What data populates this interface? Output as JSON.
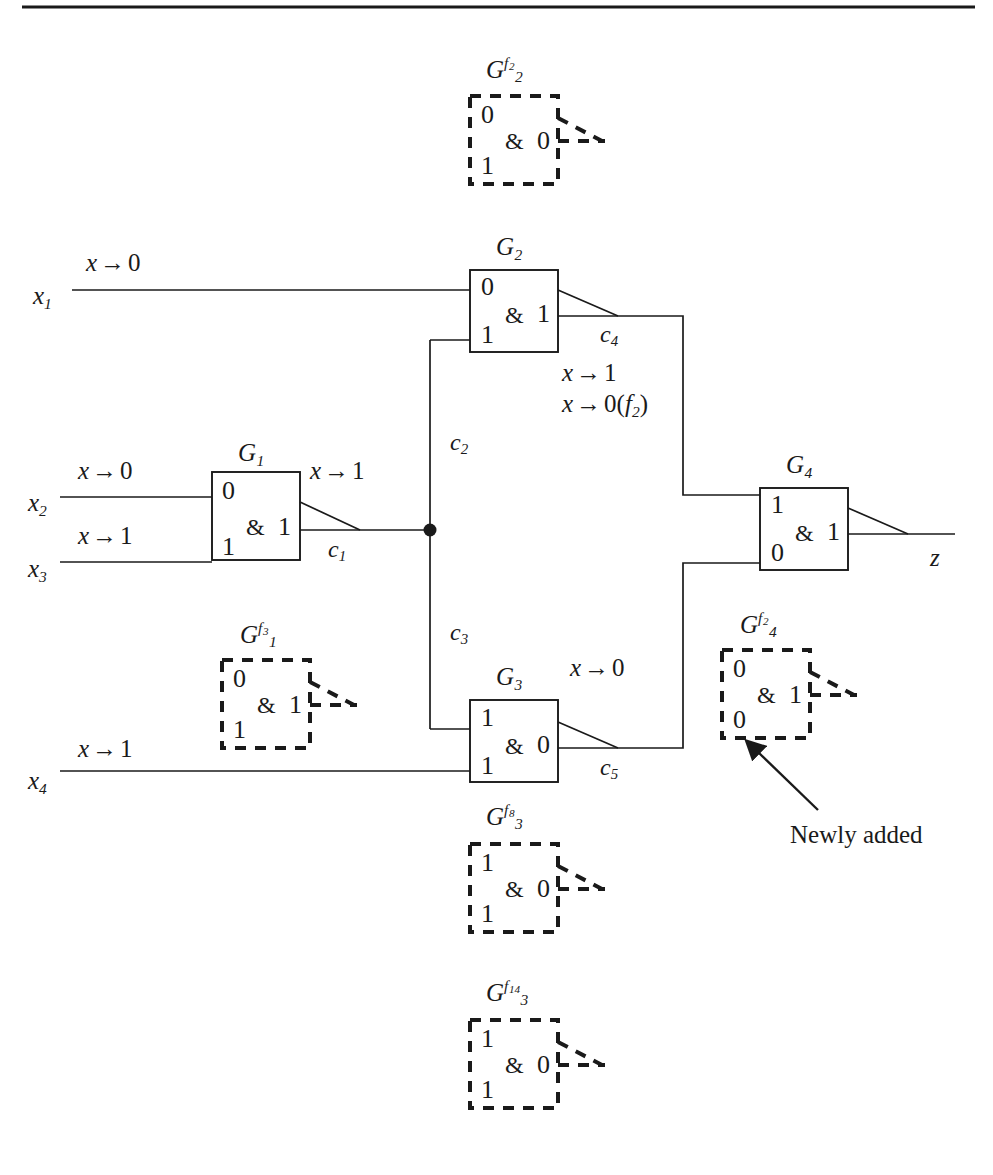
{
  "figure": {
    "type": "logic-circuit-diagram",
    "top_rule": true,
    "colors": {
      "ink": "#1a1a1a",
      "background": "#ffffff"
    },
    "annotation_note": "Newly added"
  },
  "inputs": [
    {
      "name": "x",
      "index": "1",
      "transition_var": "x",
      "transition_arrow": "→",
      "transition_value": "0"
    },
    {
      "name": "x",
      "index": "2",
      "transition_var": "x",
      "transition_arrow": "→",
      "transition_value": "0"
    },
    {
      "name": "x",
      "index": "3",
      "transition_var": "x",
      "transition_arrow": "→",
      "transition_value": "1"
    },
    {
      "name": "x",
      "index": "4",
      "transition_var": "x",
      "transition_arrow": "→",
      "transition_value": "1"
    }
  ],
  "output": {
    "name": "z"
  },
  "gates": [
    {
      "id": "G1",
      "base": "G",
      "sub": "1",
      "sup": "",
      "op": "&",
      "in_top": "0",
      "in_bottom": "1",
      "out": "1",
      "style": "solid",
      "output_net": "c1"
    },
    {
      "id": "G2",
      "base": "G",
      "sub": "2",
      "sup": "",
      "op": "&",
      "in_top": "0",
      "in_bottom": "1",
      "out": "1",
      "style": "solid",
      "output_net": "c4"
    },
    {
      "id": "G3",
      "base": "G",
      "sub": "3",
      "sup": "",
      "op": "&",
      "in_top": "1",
      "in_bottom": "1",
      "out": "0",
      "style": "solid",
      "output_net": "c5"
    },
    {
      "id": "G4",
      "base": "G",
      "sub": "4",
      "sup": "",
      "op": "&",
      "in_top": "1",
      "in_bottom": "0",
      "out": "1",
      "style": "solid",
      "output_net": "z"
    }
  ],
  "fault_gates": [
    {
      "id": "G2f2",
      "base": "G",
      "sub": "2",
      "sup_f": "f",
      "sup_idx": "2",
      "op": "&",
      "in_top": "0",
      "in_bottom": "1",
      "out": "0",
      "style": "dashed"
    },
    {
      "id": "G1f3",
      "base": "G",
      "sub": "1",
      "sup_f": "f",
      "sup_idx": "3",
      "op": "&",
      "in_top": "0",
      "in_bottom": "1",
      "out": "1",
      "style": "dashed"
    },
    {
      "id": "G4f2",
      "base": "G",
      "sub": "4",
      "sup_f": "f",
      "sup_idx": "2",
      "op": "&",
      "in_top": "0",
      "in_bottom": "0",
      "out": "1",
      "style": "dashed",
      "annotated": true
    },
    {
      "id": "G3f8",
      "base": "G",
      "sub": "3",
      "sup_f": "f",
      "sup_idx": "8",
      "op": "&",
      "in_top": "1",
      "in_bottom": "1",
      "out": "0",
      "style": "dashed"
    },
    {
      "id": "G3f14",
      "base": "G",
      "sub": "3",
      "sup_f": "f",
      "sup_idx": "14",
      "op": "&",
      "in_top": "1",
      "in_bottom": "1",
      "out": "0",
      "style": "dashed"
    }
  ],
  "nets": [
    {
      "name": "c",
      "sub": "1"
    },
    {
      "name": "c",
      "sub": "2"
    },
    {
      "name": "c",
      "sub": "3"
    },
    {
      "name": "c",
      "sub": "4"
    },
    {
      "name": "c",
      "sub": "5"
    }
  ],
  "transitions": [
    {
      "at": "x1-input",
      "var": "x",
      "arrow": "→",
      "value": "0"
    },
    {
      "at": "x2-input",
      "var": "x",
      "arrow": "→",
      "value": "0"
    },
    {
      "at": "x3-input",
      "var": "x",
      "arrow": "→",
      "value": "1"
    },
    {
      "at": "x4-input",
      "var": "x",
      "arrow": "→",
      "value": "1"
    },
    {
      "at": "c1-net",
      "var": "x",
      "arrow": "→",
      "value": "1"
    },
    {
      "at": "c4-net-a",
      "var": "x",
      "arrow": "→",
      "value": "1"
    },
    {
      "at": "c4-net-b",
      "var": "x",
      "arrow": "→",
      "value": "0",
      "qualifier_open": "(",
      "qualifier_f": "f",
      "qualifier_sub": "2",
      "qualifier_close": ")"
    },
    {
      "at": "c5-net",
      "var": "x",
      "arrow": "→",
      "value": "0"
    }
  ],
  "labels": {
    "x1": "x",
    "x1sub": "1",
    "x2": "x",
    "x2sub": "2",
    "x3": "x",
    "x3sub": "3",
    "x4": "x",
    "x4sub": "4",
    "z": "z",
    "newly_added": "Newly added",
    "amp": "&",
    "arrow": "→",
    "xvar": "x"
  }
}
